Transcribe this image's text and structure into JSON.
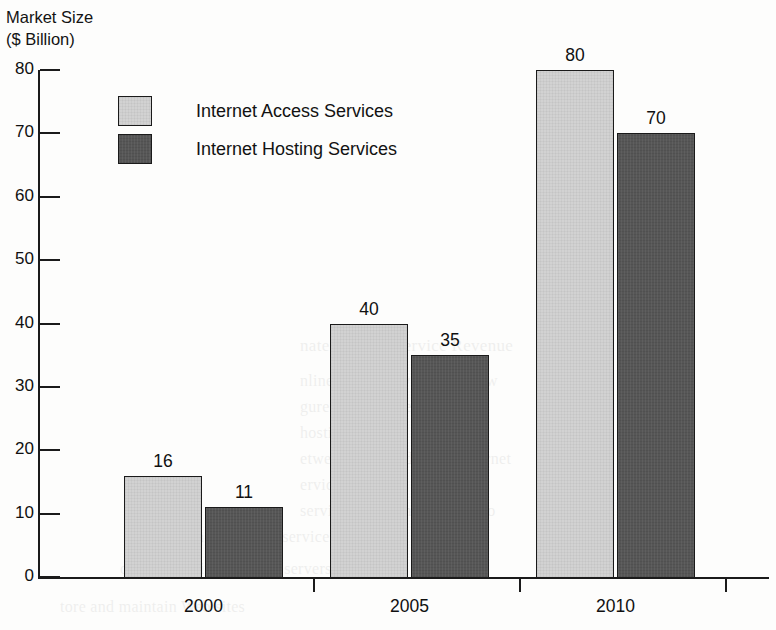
{
  "chart_data": {
    "type": "bar",
    "title_lines": [
      "Market Size",
      "($ Billion)"
    ],
    "xlabel": "",
    "ylabel": "Market Size ($ Billion)",
    "categories": [
      "2000",
      "2005",
      "2010"
    ],
    "series": [
      {
        "name": "Internet Access Services",
        "color": "#d2d2d2",
        "values": [
          16,
          40,
          80
        ]
      },
      {
        "name": "Internet Hosting Services",
        "color": "#565656",
        "values": [
          11,
          35,
          70
        ]
      }
    ],
    "ylim": [
      0,
      80
    ],
    "yticks": [
      0,
      10,
      20,
      30,
      40,
      50,
      60,
      70,
      80
    ],
    "ytick_labels": [
      "0",
      "10",
      "20",
      "30",
      "40",
      "50",
      "60",
      "70",
      "80"
    ],
    "grid": false,
    "legend_position": "upper-left-inside",
    "data_labels": true,
    "data_label_values": [
      [
        "16",
        "11"
      ],
      [
        "40",
        "35"
      ],
      [
        "80",
        "70"
      ]
    ]
  },
  "legend": {
    "items": [
      {
        "label": "Internet Access Services",
        "swatch": "light-gray-swatch"
      },
      {
        "label": "Internet Hosting Services",
        "swatch": "dark-gray-swatch"
      }
    ]
  },
  "background_ghost_text": {
    "note": "faint bleed-through of text from the reverse side of the scanned page",
    "lines": [
      "nate Internet Service Revenue",
      "nline service revenue to grow",
      "gure shows the estimated",
      "hosting",
      "etween 2000 and 2010. Internet",
      "ervices are",
      "services that connect users to",
      "nternet. Hosting services provide",
      "ompanies with space on servers",
      "tore and maintain Web sites"
    ]
  }
}
